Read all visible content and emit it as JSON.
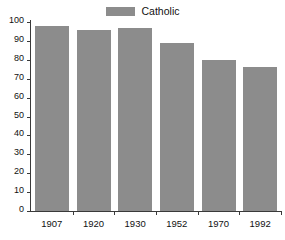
{
  "chart_data": {
    "type": "bar",
    "title": "",
    "subtitle": "",
    "xlabel": "",
    "ylabel": "",
    "categories": [
      "1907",
      "1920",
      "1930",
      "1952",
      "1970",
      "1992"
    ],
    "series": [
      {
        "name": "Catholic",
        "color": "#8c8c8c",
        "values": [
          98,
          96,
          97,
          89,
          80,
          76
        ]
      }
    ],
    "ylim": [
      0,
      100
    ],
    "ytick_labels": [
      "100",
      "90",
      "80",
      "70",
      "60",
      "50",
      "40",
      "30",
      "20",
      "10",
      "0"
    ],
    "ytick_values": [
      100,
      90,
      80,
      70,
      60,
      50,
      40,
      30,
      20,
      10,
      0
    ],
    "grid": false,
    "legend": {
      "position": "top-center",
      "entries": [
        {
          "label": "Catholic",
          "color": "#8c8c8c",
          "swatch_icon": "legend-swatch-icon"
        }
      ]
    },
    "axes": {
      "y_axis_color": "#3a3a3a",
      "x_axis_color": "#3a3a3a",
      "tick_color": "#3a3a3a"
    },
    "background_color": "#ffffff",
    "text_color": "#111111"
  }
}
